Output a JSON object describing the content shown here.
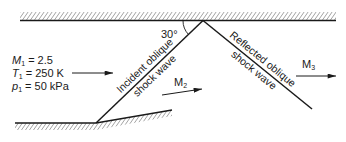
{
  "figure": {
    "title": "Reflected oblique shock wave",
    "angle_label": "30°",
    "upstream": {
      "mach_symbol": "M",
      "mach_sub": "1",
      "mach_value": " = 2.5",
      "temp_symbol": "T",
      "temp_sub": "1",
      "temp_value": " = 250 K",
      "pressure_symbol": "p",
      "pressure_sub": "1",
      "pressure_value": " = 50 kPa"
    },
    "incident_shock": {
      "line1": "Incident oblique",
      "line2": "shock wave"
    },
    "reflected_shock": {
      "line1": "Reflected oblique",
      "line2": "shock wave"
    },
    "region2": {
      "symbol": "M",
      "sub": "2"
    },
    "region3": {
      "symbol": "M",
      "sub": "3"
    },
    "colors": {
      "ink": "#1a1a1a",
      "background": "#ffffff"
    }
  }
}
